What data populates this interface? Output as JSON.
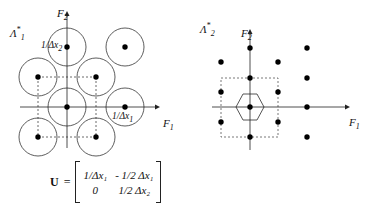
{
  "left_diagram": {
    "lattice_label": "Λ",
    "lattice_sup": "*",
    "lattice_sub": "1",
    "axis_x": {
      "label": "F",
      "sub": "1"
    },
    "axis_y": {
      "label": "F",
      "sub": "2"
    },
    "tick_y": {
      "label": "1/Δx",
      "sub": "2"
    },
    "tick_x": {
      "label": "1/Δx",
      "sub": "1"
    },
    "points": [
      [
        67,
        47
      ],
      [
        125,
        47
      ],
      [
        38,
        77
      ],
      [
        96,
        77
      ],
      [
        67,
        107
      ],
      [
        125,
        107
      ],
      [
        38,
        137
      ],
      [
        96,
        137
      ]
    ],
    "circle_radius": 19
  },
  "right_diagram": {
    "lattice_label": "Λ",
    "lattice_sup": "*",
    "lattice_sub": "2",
    "axis_x": {
      "label": "F",
      "sub": "1"
    },
    "axis_y": {
      "label": "F",
      "sub": "2"
    },
    "points": [
      [
        250,
        48
      ],
      [
        307,
        48
      ],
      [
        221,
        62
      ],
      [
        278,
        62
      ],
      [
        250,
        78
      ],
      [
        307,
        78
      ],
      [
        221,
        92
      ],
      [
        278,
        92
      ],
      [
        250,
        107
      ],
      [
        307,
        107
      ],
      [
        221,
        122
      ],
      [
        278,
        122
      ],
      [
        250,
        137
      ],
      [
        307,
        137
      ]
    ]
  },
  "matrix": {
    "symbol": "U",
    "equals": "=",
    "cells": [
      "1/Δx₁",
      "- 1/2 Δx₁",
      "0",
      "1/2 Δx₂"
    ]
  }
}
